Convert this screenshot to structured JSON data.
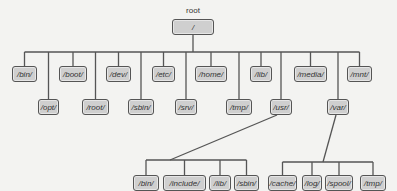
{
  "diagram": {
    "title_label": "root",
    "root": {
      "label": "/",
      "x": 172,
      "y": 19,
      "w": 42
    },
    "level1_top": [
      {
        "label": "/bin/",
        "x": 12,
        "w": 25
      },
      {
        "label": "/boot/",
        "x": 59,
        "w": 28
      },
      {
        "label": "/dev/",
        "x": 106,
        "w": 25
      },
      {
        "label": "/etc/",
        "x": 152,
        "w": 23
      },
      {
        "label": "/home/",
        "x": 195,
        "w": 32
      },
      {
        "label": "/lib/",
        "x": 250,
        "w": 22
      },
      {
        "label": "/media/",
        "x": 294,
        "w": 33
      },
      {
        "label": "/mnt/",
        "x": 347,
        "w": 25
      }
    ],
    "level1_bottom": [
      {
        "label": "/opt/",
        "x": 38,
        "w": 21
      },
      {
        "label": "/root/",
        "x": 82,
        "w": 27
      },
      {
        "label": "/sbin/",
        "x": 128,
        "w": 26
      },
      {
        "label": "/srv/",
        "x": 175,
        "w": 22
      },
      {
        "label": "/tmp/",
        "x": 226,
        "w": 26
      },
      {
        "label": "/usr/",
        "x": 270,
        "w": 22
      },
      {
        "label": "/var/",
        "x": 327,
        "w": 22
      }
    ],
    "usr_children": [
      {
        "label": "/bin/",
        "x": 133,
        "w": 26
      },
      {
        "label": "/include/",
        "x": 163,
        "w": 43
      },
      {
        "label": "/lib/",
        "x": 209,
        "w": 22
      },
      {
        "label": "/sbin/",
        "x": 234,
        "w": 25
      }
    ],
    "var_children": [
      {
        "label": "/cache/",
        "x": 268,
        "w": 29
      },
      {
        "label": "/log/",
        "x": 302,
        "w": 20
      },
      {
        "label": "/spool/",
        "x": 325,
        "w": 28
      },
      {
        "label": "/tmp/",
        "x": 360,
        "w": 26
      }
    ]
  }
}
